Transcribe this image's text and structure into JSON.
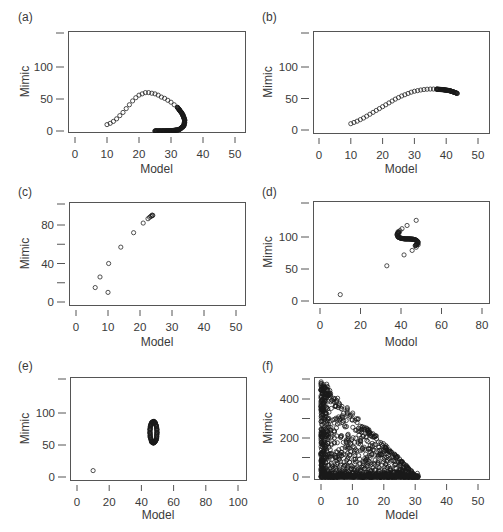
{
  "figure": {
    "width": 503,
    "height": 532,
    "colors": {
      "frame": "#555555",
      "marker": "#1a1a1a",
      "text": "#3a3a3a",
      "background": "#ffffff"
    }
  },
  "chart_data": [
    {
      "id": "a",
      "panel_label": "(a)",
      "type": "scatter",
      "xlabel": "Model",
      "ylabel": "Mimic",
      "xticks": [
        0,
        10,
        20,
        30,
        40,
        50
      ],
      "yticks": [
        0,
        50,
        100
      ],
      "yminor_ticks": [],
      "xlim": [
        -2,
        53
      ],
      "ylim": [
        -5,
        150
      ],
      "frame": {
        "x": 68,
        "y": 31,
        "w": 177,
        "h": 101
      },
      "tick_px": {
        "x0": 75,
        "x1": 235,
        "xv0": 0,
        "xv1": 50,
        "y0": 131,
        "y1": 67,
        "yv0": 0,
        "yv1": 100
      },
      "label_pos": {
        "panel": [
          18,
          21
        ],
        "ylabel_x": 29,
        "xlabel_y": 173
      },
      "description": "Open-circle trajectory rising from (10,10) to peak ~(22,60), curving down to (34,15), then densely packed back along y≈0 to x≈25",
      "series": [
        {
          "name": "rise",
          "points": [
            [
              10,
              10
            ],
            [
              11,
              12
            ],
            [
              12,
              15
            ],
            [
              13,
              19
            ],
            [
              14,
              24
            ],
            [
              15,
              29
            ],
            [
              16,
              35
            ],
            [
              17,
              41
            ],
            [
              18,
              47
            ],
            [
              19,
              52
            ],
            [
              20,
              56
            ],
            [
              21,
              58
            ],
            [
              22,
              60
            ],
            [
              23,
              60
            ],
            [
              24,
              59
            ],
            [
              25,
              58
            ],
            [
              26,
              56
            ],
            [
              27,
              53
            ],
            [
              28,
              51
            ],
            [
              29,
              48
            ],
            [
              30,
              45
            ],
            [
              31,
              41
            ],
            [
              32,
              37
            ],
            [
              32.7,
              33
            ],
            [
              33.3,
              29
            ],
            [
              33.8,
              25
            ],
            [
              34.1,
              21
            ],
            [
              34.3,
              17
            ],
            [
              34.3,
              13
            ],
            [
              34.1,
              9
            ],
            [
              33.7,
              6
            ],
            [
              33.1,
              3.5
            ],
            [
              32.4,
              2
            ],
            [
              31.5,
              1
            ],
            [
              30.5,
              0.5
            ],
            [
              29.5,
              0.2
            ],
            [
              28.5,
              0
            ],
            [
              27.5,
              0
            ],
            [
              26.5,
              0
            ],
            [
              25.5,
              0
            ],
            [
              25,
              0
            ]
          ]
        },
        {
          "name": "dense-tail",
          "dense_path": [
            [
              32,
              37
            ],
            [
              33.5,
              27
            ],
            [
              34.3,
              17
            ],
            [
              34,
              8
            ],
            [
              32.5,
              2
            ],
            [
              30,
              0.3
            ],
            [
              27,
              0
            ],
            [
              25,
              0
            ]
          ],
          "dense_n": 120
        }
      ]
    },
    {
      "id": "b",
      "panel_label": "(b)",
      "type": "scatter",
      "xlabel": "Model",
      "ylabel": "Mimic",
      "xticks": [
        0,
        10,
        20,
        30,
        40,
        50
      ],
      "yticks": [
        0,
        50,
        100
      ],
      "yminor_ticks": [],
      "xlim": [
        -2,
        53
      ],
      "ylim": [
        -5,
        150
      ],
      "frame": {
        "x": 313,
        "y": 31,
        "w": 176,
        "h": 102
      },
      "tick_px": {
        "x0": 319,
        "x1": 478,
        "xv0": 0,
        "xv1": 50,
        "y0": 130,
        "y1": 67,
        "yv0": 0,
        "yv1": 100
      },
      "label_pos": {
        "panel": [
          262,
          21
        ],
        "ylabel_x": 272,
        "xlabel_y": 173
      },
      "description": "Smooth sigmoid-like curve of open circles from (10,10) rising to ~(36,65), slight decline to (43.5,58), dense near the end",
      "series": [
        {
          "name": "curve",
          "points": [
            [
              10,
              10
            ],
            [
              11,
              12
            ],
            [
              12,
              14
            ],
            [
              13,
              16.5
            ],
            [
              14,
              19
            ],
            [
              15,
              22
            ],
            [
              16,
              25
            ],
            [
              17,
              28
            ],
            [
              18,
              31
            ],
            [
              19,
              34
            ],
            [
              20,
              37
            ],
            [
              21,
              40
            ],
            [
              22,
              43
            ],
            [
              23,
              46
            ],
            [
              24,
              49
            ],
            [
              25,
              51.5
            ],
            [
              26,
              54
            ],
            [
              27,
              56
            ],
            [
              28,
              58
            ],
            [
              29,
              60
            ],
            [
              30,
              61.5
            ],
            [
              31,
              62.5
            ],
            [
              32,
              63.5
            ],
            [
              33,
              64.2
            ],
            [
              34,
              64.7
            ],
            [
              35,
              65
            ],
            [
              36,
              65
            ],
            [
              37,
              64.8
            ]
          ]
        },
        {
          "name": "dense-tail",
          "dense_path": [
            [
              37,
              64.8
            ],
            [
              39,
              64
            ],
            [
              41,
              62.5
            ],
            [
              42.5,
              60
            ],
            [
              43.5,
              58
            ]
          ],
          "dense_n": 60
        }
      ]
    },
    {
      "id": "c",
      "panel_label": "(c)",
      "type": "scatter",
      "xlabel": "Model",
      "ylabel": "Mimic",
      "xticks": [
        0,
        10,
        20,
        30,
        40,
        50
      ],
      "yticks": [
        0,
        40,
        80
      ],
      "yminor_ticks": [
        20,
        60
      ],
      "xlim": [
        -2,
        53
      ],
      "ylim": [
        -4,
        100
      ],
      "frame": {
        "x": 69,
        "y": 202,
        "w": 176,
        "h": 103
      },
      "tick_px": {
        "x0": 76,
        "x1": 236,
        "xv0": 0,
        "xv1": 50,
        "y0": 302,
        "y1": 225,
        "yv0": 0,
        "yv1": 80
      },
      "label_pos": {
        "panel": [
          18,
          196
        ],
        "ylabel_x": 29,
        "xlabel_y": 346
      },
      "description": "Sparse open circles rising steeply from (6,15) to cluster near (24,90)",
      "series": [
        {
          "name": "points",
          "points": [
            [
              6,
              15
            ],
            [
              7.5,
              26
            ],
            [
              10,
              10
            ],
            [
              10.2,
              40
            ],
            [
              14,
              57
            ],
            [
              18,
              72
            ],
            [
              21,
              82
            ],
            [
              22.5,
              86.5
            ],
            [
              23,
              88
            ],
            [
              23.4,
              89
            ],
            [
              23.7,
              89.5
            ],
            [
              24,
              90
            ],
            [
              23.8,
              90.3
            ]
          ]
        }
      ]
    },
    {
      "id": "d",
      "panel_label": "(d)",
      "type": "scatter",
      "xlabel": "Modol",
      "ylabel": "Mimic",
      "xticks": [
        0,
        20,
        40,
        60,
        80
      ],
      "yticks": [
        0,
        50,
        100
      ],
      "yminor_ticks": [],
      "xlim": [
        -3,
        83
      ],
      "ylim": [
        -5,
        150
      ],
      "frame": {
        "x": 313,
        "y": 201,
        "w": 176,
        "h": 102
      },
      "tick_px": {
        "x0": 320,
        "x1": 482,
        "xv0": 0,
        "xv1": 80,
        "y0": 301,
        "y1": 237,
        "yv0": 0,
        "yv1": 100
      },
      "label_pos": {
        "panel": [
          262,
          196
        ],
        "ylabel_x": 272,
        "xlabel_y": 346
      },
      "description": "Outlier points at (10,10) and (33,55) plus an S-shaped dense cluster around (43,95) with scattered points up to (48,126)",
      "series": [
        {
          "name": "points",
          "points": [
            [
              10,
              10
            ],
            [
              33,
              55
            ],
            [
              41.5,
              72
            ],
            [
              45.5,
              79
            ],
            [
              47.5,
              84
            ],
            [
              48.5,
              88
            ],
            [
              40.5,
              113
            ],
            [
              43,
              118
            ],
            [
              47.5,
              126
            ],
            [
              38.5,
              108
            ],
            [
              39.5,
              110
            ],
            [
              39,
              106
            ]
          ]
        },
        {
          "name": "s-curve",
          "dense_path": [
            [
              39,
              108
            ],
            [
              38,
              104
            ],
            [
              38.5,
              100
            ],
            [
              40,
              98
            ],
            [
              42,
              97
            ],
            [
              44,
              97
            ],
            [
              46,
              96.5
            ],
            [
              47.5,
              95
            ],
            [
              48.5,
              92
            ],
            [
              48,
              88.5
            ],
            [
              47,
              86.5
            ]
          ],
          "dense_n": 70
        }
      ]
    },
    {
      "id": "e",
      "panel_label": "(e)",
      "type": "scatter",
      "xlabel": "Model",
      "ylabel": "Mimic",
      "xticks": [
        0,
        20,
        40,
        60,
        80,
        100
      ],
      "yticks": [
        0,
        50,
        100
      ],
      "yminor_ticks": [],
      "xlim": [
        -4,
        106
      ],
      "ylim": [
        -5,
        150
      ],
      "frame": {
        "x": 70,
        "y": 377,
        "w": 176,
        "h": 103
      },
      "tick_px": {
        "x0": 77,
        "x1": 238,
        "xv0": 0,
        "xv1": 100,
        "y0": 477,
        "y1": 413,
        "yv0": 0,
        "yv1": 100
      },
      "label_pos": {
        "panel": [
          18,
          370
        ],
        "ylabel_x": 29,
        "xlabel_y": 519
      },
      "description": "Single outlier at (10,10) and a dense closed elliptical loop centered near (47,70), radius ~2 in x and ~17 in y",
      "series": [
        {
          "name": "outlier",
          "points": [
            [
              10,
              10
            ]
          ]
        },
        {
          "name": "loop",
          "ellipse": {
            "cx": 47.5,
            "cy": 70,
            "rx": 2.2,
            "ry": 16.5,
            "n": 90,
            "jitter": 0.35
          }
        }
      ]
    },
    {
      "id": "f",
      "panel_label": "(f)",
      "type": "scatter",
      "xlabel": "Model",
      "ylabel": "Mimic",
      "xticks": [
        0,
        10,
        20,
        30,
        40,
        50
      ],
      "yticks": [
        0,
        200,
        400
      ],
      "yminor_ticks": [
        100,
        300
      ],
      "xlim": [
        -2,
        53
      ],
      "ylim": [
        -20,
        520
      ],
      "frame": {
        "x": 314,
        "y": 377,
        "w": 175,
        "h": 102
      },
      "tick_px": {
        "x0": 321,
        "x1": 478,
        "xv0": 0,
        "xv1": 50,
        "y0": 477,
        "y1": 399,
        "yv0": 0,
        "yv1": 400
      },
      "label_pos": {
        "panel": [
          262,
          370
        ],
        "ylabel_x": 272,
        "xlabel_y": 519
      },
      "description": "Dense triangular cloud of open circles bounded by (0,0), (0,490) and (31,0); densest along y≈0 and near x≈0",
      "series": [
        {
          "name": "cloud",
          "triangle": {
            "x_max": 31,
            "y_max": 490,
            "n_cloud": 700,
            "n_base": 320,
            "n_left": 200,
            "seed": 7
          }
        }
      ]
    }
  ]
}
